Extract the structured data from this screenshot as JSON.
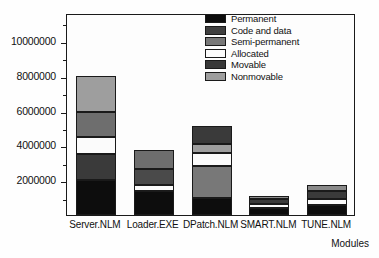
{
  "chart_data": {
    "type": "bar",
    "subtype": "stacked-bar-vertical",
    "title": "",
    "subtitle": "",
    "xlabel": "Modules",
    "ylabel": "",
    "grid": false,
    "legend_position": "top-right",
    "categories": [
      "Server.NLM",
      "Loader.EXE",
      "DPatch.NLM",
      "SMART.NLM",
      "TUNE.NLM"
    ],
    "ylim": [
      0,
      11600000
    ],
    "yticks": [
      2000000,
      4000000,
      6000000,
      8000000,
      10000000
    ],
    "ytick_labels": [
      "2000000",
      "4000000",
      "6000000",
      "8000000",
      "10000000"
    ],
    "yminor_ticks": [
      1000000,
      3000000,
      5000000,
      7000000,
      9000000,
      11000000
    ],
    "series": [
      {
        "name": "Permanent",
        "color": "#0d0d0d",
        "values": [
          2000000,
          1400000,
          1000000,
          400000,
          600000
        ]
      },
      {
        "name": "Code and data",
        "color": "#3a3a3a",
        "values": [
          1500000,
          0,
          0,
          0,
          0
        ]
      },
      {
        "name": "Semi-permanent",
        "color": "#7d7d7d",
        "values": [
          0,
          0,
          1800000,
          0,
          0
        ]
      },
      {
        "name": "Allocated",
        "color": "#fbfbfb",
        "values": [
          1000000,
          350000,
          750000,
          250000,
          300000
        ]
      },
      {
        "name": "Movable",
        "color": "#4a4a4a",
        "values": [
          1400000,
          900000,
          1050000,
          250000,
          450000
        ]
      },
      {
        "name": "Nonmovable",
        "color": "#9e9e9e",
        "values": [
          2100000,
          1100000,
          500000,
          200000,
          350000
        ]
      }
    ],
    "bar_totals": [
      8000000,
      3750000,
      5100000,
      1100000,
      1700000
    ],
    "stack_order_bottom_to_top": [
      "Permanent",
      "Code and data",
      "Semi-permanent",
      "Allocated",
      "Movable",
      "Nonmovable"
    ],
    "stacks": [
      {
        "category": "Server.NLM",
        "segments": [
          {
            "name": "Permanent",
            "value": 2000000,
            "color": "#0d0d0d"
          },
          {
            "name": "Code and data",
            "value": 1500000,
            "color": "#3a3a3a"
          },
          {
            "name": "Allocated",
            "value": 1000000,
            "color": "#fbfbfb"
          },
          {
            "name": "Movable",
            "value": 1400000,
            "color": "#6e6e6e"
          },
          {
            "name": "Nonmovable",
            "value": 2100000,
            "color": "#9e9e9e"
          }
        ]
      },
      {
        "category": "Loader.EXE",
        "segments": [
          {
            "name": "Permanent",
            "value": 1400000,
            "color": "#0d0d0d"
          },
          {
            "name": "Allocated",
            "value": 350000,
            "color": "#fbfbfb"
          },
          {
            "name": "Movable",
            "value": 900000,
            "color": "#4a4a4a"
          },
          {
            "name": "Nonmovable",
            "value": 1100000,
            "color": "#6e6e6e"
          }
        ]
      },
      {
        "category": "DPatch.NLM",
        "segments": [
          {
            "name": "Permanent",
            "value": 1000000,
            "color": "#0d0d0d"
          },
          {
            "name": "Semi-permanent",
            "value": 1800000,
            "color": "#787878"
          },
          {
            "name": "Allocated",
            "value": 750000,
            "color": "#fbfbfb"
          },
          {
            "name": "Nonmovable",
            "value": 500000,
            "color": "#9e9e9e"
          },
          {
            "name": "Movable",
            "value": 1050000,
            "color": "#3a3a3a"
          }
        ]
      },
      {
        "category": "SMART.NLM",
        "segments": [
          {
            "name": "Permanent",
            "value": 400000,
            "color": "#0d0d0d"
          },
          {
            "name": "Allocated",
            "value": 250000,
            "color": "#fbfbfb"
          },
          {
            "name": "Movable",
            "value": 250000,
            "color": "#3a3a3a"
          },
          {
            "name": "Nonmovable",
            "value": 200000,
            "color": "#8a8a8a"
          }
        ]
      },
      {
        "category": "TUNE.NLM",
        "segments": [
          {
            "name": "Permanent",
            "value": 600000,
            "color": "#0d0d0d"
          },
          {
            "name": "Allocated",
            "value": 300000,
            "color": "#fbfbfb"
          },
          {
            "name": "Movable",
            "value": 450000,
            "color": "#3a3a3a"
          },
          {
            "name": "Nonmovable",
            "value": 350000,
            "color": "#8a8a8a"
          }
        ]
      }
    ]
  },
  "legend": {
    "items": [
      {
        "label": "Permanent",
        "color": "#0d0d0d"
      },
      {
        "label": "Code and data",
        "color": "#3f3f3f"
      },
      {
        "label": "Semi-permanent",
        "color": "#787878"
      },
      {
        "label": "Allocated",
        "color": "#fbfbfb"
      },
      {
        "label": "Movable",
        "color": "#383838"
      },
      {
        "label": "Nonmovable",
        "color": "#9e9e9e"
      }
    ]
  },
  "axes": {
    "x_title": "Modules"
  },
  "colors": {
    "axis": "#1a1a1a",
    "background": "#fefefe",
    "plot_background": "#fdfdfd",
    "text": "#111111"
  }
}
